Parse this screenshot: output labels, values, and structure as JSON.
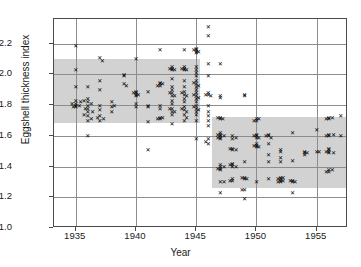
{
  "chart_data": {
    "type": "scatter",
    "title": "",
    "xlabel": "Year",
    "ylabel": "Eggshell thickness index",
    "xlim": [
      1933.2,
      1957.6
    ],
    "ylim": [
      1.0,
      2.36
    ],
    "xticks": [
      1935,
      1940,
      1945,
      1950,
      1955
    ],
    "xticklabels": [
      "1935",
      "1940",
      "1945",
      "1950",
      "1955"
    ],
    "yticks": [
      1.0,
      1.2,
      1.4,
      1.6,
      1.8,
      2.0,
      2.2
    ],
    "yticklabels": [
      "1.0",
      "1.2",
      "1.4",
      "1.6",
      "1.8",
      "2.0",
      "2.2"
    ],
    "grid": "both",
    "legend": "none",
    "marker": "x",
    "marker_color": "#000000",
    "band_color": "#d2d2d2",
    "grid_color": "#8d8d8d",
    "frame_color": "#4a4a4a",
    "bands": [
      {
        "name": "pre-DDT reference band",
        "x0": 1933.2,
        "x1": 1945.3,
        "y0": 1.68,
        "y1": 2.1
      },
      {
        "name": "post-DDT reference band",
        "x0": 1946.3,
        "x1": 1957.6,
        "y0": 1.26,
        "y1": 1.72
      }
    ],
    "series": [
      {
        "name": "Eggshell thickness measurements",
        "points": [
          [
            1935.0,
            2.19
          ],
          [
            1935.0,
            2.03
          ],
          [
            1935.0,
            1.92
          ],
          [
            1935.0,
            1.83
          ],
          [
            1935.0,
            1.81
          ],
          [
            1935.0,
            1.8
          ],
          [
            1935.0,
            1.79
          ],
          [
            1934.7,
            1.81
          ],
          [
            1935.3,
            1.8
          ],
          [
            1934.8,
            1.79
          ],
          [
            1935.4,
            1.82
          ],
          [
            1936.0,
            1.92
          ],
          [
            1936.0,
            1.84
          ],
          [
            1936.0,
            1.82
          ],
          [
            1936.0,
            1.8
          ],
          [
            1936.0,
            1.78
          ],
          [
            1936.0,
            1.76
          ],
          [
            1936.0,
            1.73
          ],
          [
            1936.0,
            1.7
          ],
          [
            1936.0,
            1.6
          ],
          [
            1935.7,
            1.83
          ],
          [
            1936.3,
            1.81
          ],
          [
            1935.8,
            1.78
          ],
          [
            1936.4,
            1.76
          ],
          [
            1935.7,
            1.74
          ],
          [
            1936.3,
            1.71
          ],
          [
            1937.0,
            2.11
          ],
          [
            1937.2,
            2.09
          ],
          [
            1937.0,
            1.96
          ],
          [
            1937.0,
            1.9
          ],
          [
            1937.0,
            1.8
          ],
          [
            1937.0,
            1.77
          ],
          [
            1937.0,
            1.73
          ],
          [
            1937.0,
            1.7
          ],
          [
            1936.8,
            1.72
          ],
          [
            1937.3,
            1.71
          ],
          [
            1938.0,
            1.82
          ],
          [
            1938.0,
            1.79
          ],
          [
            1938.2,
            1.8
          ],
          [
            1938.0,
            1.76
          ],
          [
            1939.0,
            2.0
          ],
          [
            1939.0,
            1.99
          ],
          [
            1939.0,
            1.94
          ],
          [
            1939.2,
            1.93
          ],
          [
            1940.0,
            2.1
          ],
          [
            1940.0,
            1.89
          ],
          [
            1940.0,
            1.88
          ],
          [
            1940.0,
            1.87
          ],
          [
            1940.0,
            1.86
          ],
          [
            1940.0,
            1.81
          ],
          [
            1940.0,
            1.79
          ],
          [
            1939.8,
            1.88
          ],
          [
            1940.2,
            1.87
          ],
          [
            1941.0,
            1.89
          ],
          [
            1941.0,
            1.8
          ],
          [
            1941.0,
            1.79
          ],
          [
            1941.0,
            1.69
          ],
          [
            1941.0,
            1.51
          ],
          [
            1942.0,
            2.16
          ],
          [
            1942.0,
            1.95
          ],
          [
            1942.0,
            1.94
          ],
          [
            1942.0,
            1.93
          ],
          [
            1942.0,
            1.8
          ],
          [
            1942.0,
            1.78
          ],
          [
            1942.0,
            1.72
          ],
          [
            1942.0,
            1.71
          ],
          [
            1942.2,
            1.94
          ],
          [
            1941.8,
            1.93
          ],
          [
            1942.2,
            1.72
          ],
          [
            1941.8,
            1.71
          ],
          [
            1943.0,
            2.05
          ],
          [
            1943.0,
            2.04
          ],
          [
            1943.0,
            2.03
          ],
          [
            1943.0,
            1.97
          ],
          [
            1943.0,
            1.92
          ],
          [
            1943.0,
            1.9
          ],
          [
            1943.0,
            1.88
          ],
          [
            1943.0,
            1.86
          ],
          [
            1943.0,
            1.83
          ],
          [
            1943.0,
            1.81
          ],
          [
            1943.0,
            1.78
          ],
          [
            1943.0,
            1.76
          ],
          [
            1943.0,
            1.74
          ],
          [
            1943.0,
            1.68
          ],
          [
            1942.8,
            2.04
          ],
          [
            1943.2,
            2.03
          ],
          [
            1942.8,
            1.88
          ],
          [
            1943.2,
            1.86
          ],
          [
            1942.8,
            1.78
          ],
          [
            1943.2,
            1.76
          ],
          [
            1944.0,
            2.16
          ],
          [
            1944.0,
            2.05
          ],
          [
            1944.0,
            2.04
          ],
          [
            1944.0,
            2.03
          ],
          [
            1944.0,
            1.96
          ],
          [
            1944.0,
            1.92
          ],
          [
            1944.0,
            1.89
          ],
          [
            1944.0,
            1.87
          ],
          [
            1944.0,
            1.84
          ],
          [
            1944.0,
            1.82
          ],
          [
            1944.0,
            1.79
          ],
          [
            1944.0,
            1.77
          ],
          [
            1944.0,
            1.74
          ],
          [
            1944.0,
            1.7
          ],
          [
            1943.8,
            2.04
          ],
          [
            1944.2,
            2.03
          ],
          [
            1943.8,
            1.88
          ],
          [
            1944.2,
            1.86
          ],
          [
            1943.8,
            1.78
          ],
          [
            1944.2,
            1.76
          ],
          [
            1944.2,
            1.72
          ],
          [
            1945.0,
            2.17
          ],
          [
            1945.0,
            2.16
          ],
          [
            1945.0,
            2.15
          ],
          [
            1945.0,
            2.14
          ],
          [
            1945.0,
            2.05
          ],
          [
            1945.0,
            2.03
          ],
          [
            1945.0,
            2.01
          ],
          [
            1945.0,
            1.99
          ],
          [
            1945.0,
            1.96
          ],
          [
            1945.0,
            1.94
          ],
          [
            1945.0,
            1.92
          ],
          [
            1945.0,
            1.9
          ],
          [
            1945.0,
            1.88
          ],
          [
            1945.0,
            1.86
          ],
          [
            1945.0,
            1.84
          ],
          [
            1945.0,
            1.82
          ],
          [
            1945.0,
            1.8
          ],
          [
            1945.0,
            1.78
          ],
          [
            1945.0,
            1.76
          ],
          [
            1945.0,
            1.74
          ],
          [
            1945.0,
            1.7
          ],
          [
            1945.0,
            1.58
          ],
          [
            1944.8,
            2.16
          ],
          [
            1945.2,
            2.15
          ],
          [
            1944.8,
            1.95
          ],
          [
            1945.2,
            1.93
          ],
          [
            1944.8,
            1.87
          ],
          [
            1945.2,
            1.85
          ],
          [
            1944.8,
            1.79
          ],
          [
            1945.2,
            1.77
          ],
          [
            1946.0,
            2.31
          ],
          [
            1946.0,
            2.25
          ],
          [
            1946.0,
            2.07
          ],
          [
            1946.0,
            1.99
          ],
          [
            1946.0,
            1.88
          ],
          [
            1946.0,
            1.87
          ],
          [
            1946.0,
            1.8
          ],
          [
            1946.0,
            1.76
          ],
          [
            1946.0,
            1.73
          ],
          [
            1946.0,
            1.7
          ],
          [
            1946.0,
            1.67
          ],
          [
            1946.0,
            1.58
          ],
          [
            1946.0,
            1.55
          ],
          [
            1945.8,
            1.87
          ],
          [
            1946.2,
            1.86
          ],
          [
            1945.8,
            1.56
          ],
          [
            1947.0,
            2.07
          ],
          [
            1947.0,
            1.86
          ],
          [
            1947.0,
            1.85
          ],
          [
            1947.0,
            1.72
          ],
          [
            1947.0,
            1.71
          ],
          [
            1947.0,
            1.62
          ],
          [
            1947.0,
            1.61
          ],
          [
            1947.0,
            1.6
          ],
          [
            1947.0,
            1.59
          ],
          [
            1947.0,
            1.58
          ],
          [
            1947.0,
            1.41
          ],
          [
            1947.0,
            1.4
          ],
          [
            1947.0,
            1.39
          ],
          [
            1947.0,
            1.38
          ],
          [
            1947.0,
            1.3
          ],
          [
            1947.0,
            1.23
          ],
          [
            1946.8,
            1.72
          ],
          [
            1947.2,
            1.71
          ],
          [
            1946.8,
            1.61
          ],
          [
            1947.3,
            1.6
          ],
          [
            1946.8,
            1.59
          ],
          [
            1947.3,
            1.4
          ],
          [
            1946.8,
            1.39
          ],
          [
            1947.3,
            1.3
          ],
          [
            1948.0,
            1.6
          ],
          [
            1948.0,
            1.58
          ],
          [
            1948.0,
            1.52
          ],
          [
            1948.0,
            1.51
          ],
          [
            1948.0,
            1.42
          ],
          [
            1948.0,
            1.41
          ],
          [
            1948.0,
            1.4
          ],
          [
            1948.0,
            1.32
          ],
          [
            1948.0,
            1.31
          ],
          [
            1948.3,
            1.59
          ],
          [
            1947.8,
            1.52
          ],
          [
            1948.3,
            1.51
          ],
          [
            1947.8,
            1.41
          ],
          [
            1948.3,
            1.4
          ],
          [
            1947.8,
            1.31
          ],
          [
            1949.0,
            1.87
          ],
          [
            1949.0,
            1.86
          ],
          [
            1949.0,
            1.43
          ],
          [
            1949.0,
            1.33
          ],
          [
            1949.0,
            1.32
          ],
          [
            1949.0,
            1.25
          ],
          [
            1949.0,
            1.19
          ],
          [
            1948.8,
            1.33
          ],
          [
            1949.2,
            1.32
          ],
          [
            1948.8,
            1.25
          ],
          [
            1950.0,
            1.71
          ],
          [
            1950.0,
            1.7
          ],
          [
            1950.0,
            1.61
          ],
          [
            1950.0,
            1.6
          ],
          [
            1950.0,
            1.59
          ],
          [
            1950.0,
            1.55
          ],
          [
            1950.0,
            1.54
          ],
          [
            1950.0,
            1.53
          ],
          [
            1950.0,
            1.3
          ],
          [
            1949.8,
            1.7
          ],
          [
            1950.2,
            1.71
          ],
          [
            1949.8,
            1.6
          ],
          [
            1950.2,
            1.59
          ],
          [
            1949.8,
            1.54
          ],
          [
            1950.2,
            1.53
          ],
          [
            1951.0,
            1.61
          ],
          [
            1951.0,
            1.6
          ],
          [
            1951.0,
            1.55
          ],
          [
            1951.0,
            1.48
          ],
          [
            1951.0,
            1.43
          ],
          [
            1951.0,
            1.32
          ],
          [
            1950.8,
            1.6
          ],
          [
            1951.2,
            1.59
          ],
          [
            1952.0,
            1.51
          ],
          [
            1952.0,
            1.5
          ],
          [
            1952.0,
            1.46
          ],
          [
            1952.0,
            1.43
          ],
          [
            1952.0,
            1.33
          ],
          [
            1952.0,
            1.32
          ],
          [
            1952.0,
            1.31
          ],
          [
            1952.0,
            1.3
          ],
          [
            1951.8,
            1.32
          ],
          [
            1952.2,
            1.31
          ],
          [
            1951.8,
            1.3
          ],
          [
            1952.2,
            1.33
          ],
          [
            1953.0,
            1.62
          ],
          [
            1953.0,
            1.44
          ],
          [
            1953.0,
            1.31
          ],
          [
            1953.0,
            1.3
          ],
          [
            1953.0,
            1.23
          ],
          [
            1952.8,
            1.31
          ],
          [
            1953.2,
            1.3
          ],
          [
            1954.0,
            1.5
          ],
          [
            1954.0,
            1.49
          ],
          [
            1954.0,
            1.48
          ],
          [
            1954.2,
            1.49
          ],
          [
            1955.0,
            1.64
          ],
          [
            1955.0,
            1.5
          ],
          [
            1955.2,
            1.5
          ],
          [
            1956.0,
            1.72
          ],
          [
            1956.0,
            1.71
          ],
          [
            1956.0,
            1.61
          ],
          [
            1956.0,
            1.6
          ],
          [
            1956.0,
            1.52
          ],
          [
            1956.0,
            1.51
          ],
          [
            1956.0,
            1.5
          ],
          [
            1956.0,
            1.49
          ],
          [
            1956.0,
            1.38
          ],
          [
            1956.0,
            1.37
          ],
          [
            1955.8,
            1.71
          ],
          [
            1956.3,
            1.72
          ],
          [
            1955.8,
            1.6
          ],
          [
            1956.4,
            1.61
          ],
          [
            1955.8,
            1.5
          ],
          [
            1956.4,
            1.49
          ],
          [
            1955.8,
            1.37
          ],
          [
            1956.3,
            1.38
          ],
          [
            1957.0,
            1.73
          ],
          [
            1957.0,
            1.6
          ]
        ]
      }
    ]
  }
}
